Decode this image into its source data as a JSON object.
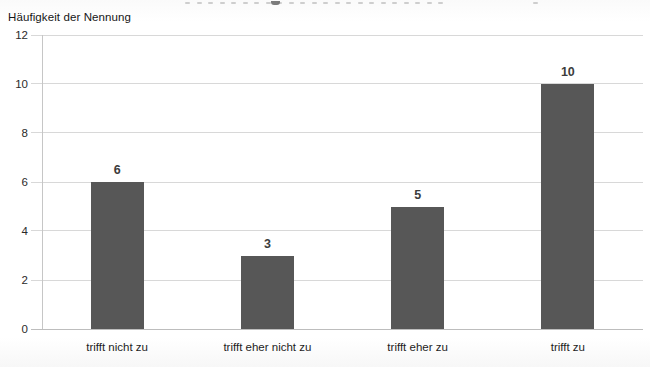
{
  "colors": {
    "bar": "#575757",
    "grid": "#d8d8d8",
    "axis_line": "#c6c6c6",
    "baseline": "#bdbdbd",
    "value_label": "#3c3c3c",
    "tick_label": "#2a2a2a",
    "category_label": "#1d1d1d",
    "background": "#ffffff"
  },
  "chart_data": {
    "type": "bar",
    "title": "",
    "ylabel": "Häufigkeit der Nennung",
    "xlabel": "",
    "categories": [
      "trifft nicht zu",
      "trifft eher nicht zu",
      "trifft eher zu",
      "trifft zu"
    ],
    "values": [
      6,
      3,
      5,
      10
    ],
    "value_labels": [
      "6",
      "3",
      "5",
      "10"
    ],
    "y_ticks": [
      12,
      10,
      8,
      6,
      4,
      2,
      0
    ],
    "ylim": [
      0,
      12
    ],
    "grid": true,
    "legend_position": "none",
    "bar_color": "#575757"
  }
}
